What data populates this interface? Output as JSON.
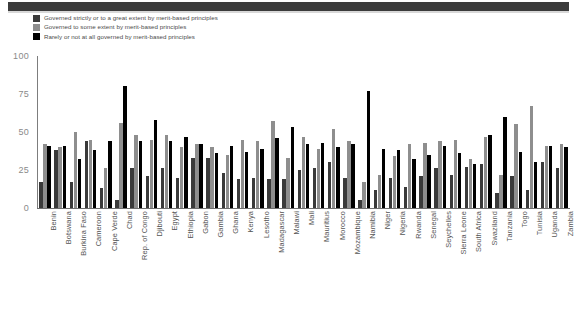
{
  "header": {
    "band_color": "#3b3b3b"
  },
  "legend": {
    "position": "top-left",
    "items": [
      {
        "label": "Governed strictly or to a great extent by merit-based principles",
        "color": "#3a3a3a",
        "swatch_name": "legend-swatch-strictly"
      },
      {
        "label": "Governed to some extent by merit-based principles",
        "color": "#8e8e8e",
        "swatch_name": "legend-swatch-some"
      },
      {
        "label": "Rarely or not at all governed by merit-based principles",
        "color": "#000000",
        "swatch_name": "legend-swatch-rarely"
      }
    ]
  },
  "chart_data": {
    "type": "bar",
    "title": "",
    "subtitle": "",
    "xlabel": "",
    "ylabel": "",
    "ylim": [
      0,
      100
    ],
    "yticks": [
      0,
      25,
      50,
      75,
      100
    ],
    "grid": false,
    "legend_position": "top-left",
    "orientation": "vertical",
    "grouping": "grouped",
    "categories": [
      "Benin",
      "Botswana",
      "Burkina Faso",
      "Cameroon",
      "Cape Verde",
      "Chad",
      "Rep. of Congo",
      "Djibouti",
      "Egypt",
      "Ethiopia",
      "Gabon",
      "Gambia",
      "Ghana",
      "Kenya",
      "Lesotho",
      "Madagascar",
      "Malawi",
      "Mali",
      "Mauritius",
      "Morocco",
      "Mozambique",
      "Namibia",
      "Niger",
      "Nigeria",
      "Rwanda",
      "Senegal",
      "Seychelles",
      "Sierra Leone",
      "South Africa",
      "Swaziland",
      "Tanzania",
      "Togo",
      "Tunisia",
      "Uganda",
      "Zambia"
    ],
    "series": [
      {
        "name": "Governed strictly or to a great extent by merit-based principles",
        "color": "#3a3a3a",
        "values": [
          17,
          38,
          17,
          44,
          13,
          5,
          26,
          21,
          26,
          20,
          33,
          33,
          23,
          19,
          20,
          19,
          19,
          25,
          26,
          30,
          20,
          5,
          12,
          20,
          14,
          21,
          26,
          22,
          27,
          29,
          10,
          21,
          12,
          30,
          26
        ]
      },
      {
        "name": "Governed to some extent by merit-based principles",
        "color": "#8e8e8e",
        "values": [
          42,
          40,
          50,
          45,
          26,
          56,
          48,
          45,
          48,
          40,
          42,
          40,
          35,
          45,
          44,
          57,
          33,
          47,
          39,
          52,
          44,
          17,
          22,
          34,
          42,
          43,
          44,
          45,
          32,
          47,
          22,
          55,
          67,
          41,
          42
        ]
      },
      {
        "name": "Rarely or not at all governed by merit-based principles",
        "color": "#000000",
        "values": [
          41,
          41,
          32,
          38,
          44,
          80,
          44,
          58,
          44,
          47,
          42,
          36,
          41,
          37,
          39,
          46,
          53,
          42,
          43,
          40,
          42,
          77,
          39,
          38,
          32,
          35,
          41,
          36,
          29,
          48,
          60,
          37,
          30,
          41,
          40
        ]
      }
    ]
  }
}
